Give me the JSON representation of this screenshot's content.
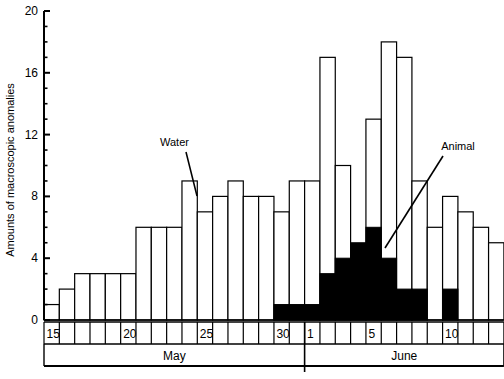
{
  "chart_data": {
    "type": "bar",
    "title": "",
    "xlabel": "",
    "ylabel": "Amounts of macroscopic anomalies",
    "ylim": [
      0,
      20
    ],
    "ytick_labels": [
      "0",
      "4",
      "8",
      "12",
      "16",
      "20"
    ],
    "ytick_values": [
      0,
      4,
      8,
      12,
      16,
      20
    ],
    "yminor_step": 1,
    "grid": false,
    "legend_position": "annotations-in-plot",
    "annotations": [
      {
        "label": "Water",
        "target_category": "May 23",
        "note": "leader line points to outlined (white) bar tops"
      },
      {
        "label": "Animal",
        "target_category": "June 7",
        "note": "leader line points to solid black stacked segment"
      }
    ],
    "months": [
      {
        "name": "May",
        "start_index": 0,
        "end_index": 16
      },
      {
        "name": "June",
        "start_index": 17,
        "end_index": 29
      }
    ],
    "day_tick_labels": [
      "15",
      "20",
      "25",
      "30",
      "1",
      "5",
      "10"
    ],
    "categories": [
      "May 15",
      "May 16",
      "May 17",
      "May 18",
      "May 19",
      "May 20",
      "May 21",
      "May 22",
      "May 23",
      "May 24",
      "May 25",
      "May 26",
      "May 27",
      "May 28",
      "May 29",
      "May 30",
      "May 31",
      "June 1",
      "June 2",
      "June 3",
      "June 4",
      "June 5",
      "June 6",
      "June 7",
      "June 8",
      "June 9",
      "June 10",
      "June 11",
      "June 12",
      "June 13"
    ],
    "day_numbers": [
      15,
      16,
      17,
      18,
      19,
      20,
      21,
      22,
      23,
      24,
      25,
      26,
      27,
      28,
      29,
      30,
      31,
      1,
      2,
      3,
      4,
      5,
      6,
      7,
      8,
      9,
      10,
      11,
      12,
      13
    ],
    "series": [
      {
        "name": "Water",
        "note": "outlined white bars; values are total bar height",
        "values": [
          1,
          2,
          3,
          3,
          3,
          3,
          6,
          6,
          6,
          9,
          7,
          8,
          9,
          8,
          8,
          7,
          9,
          9,
          17,
          10,
          3,
          13,
          18,
          17,
          9,
          6,
          8,
          7,
          6,
          5
        ]
      },
      {
        "name": "Animal",
        "note": "solid black segment measured from baseline",
        "values": [
          0,
          0,
          0,
          0,
          0,
          0,
          0,
          0,
          0,
          0,
          0,
          0,
          0,
          0,
          0,
          1,
          1,
          1,
          3,
          4,
          5,
          6,
          4,
          2,
          2,
          0,
          2,
          0,
          0,
          0
        ]
      }
    ]
  },
  "axis": {
    "y_title": "Amounts of macroscopic anomalies",
    "y_max_label": "20",
    "y_zero_label": "0"
  },
  "labels": {
    "water": "Water",
    "animal": "Animal",
    "may": "May",
    "june": "June"
  }
}
